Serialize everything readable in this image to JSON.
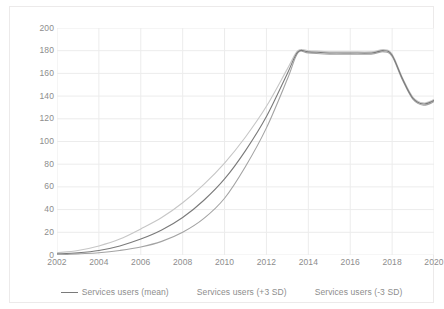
{
  "chart_data": {
    "type": "line",
    "title": "",
    "subtitle": "",
    "xlabel": "",
    "ylabel": "",
    "xlim": [
      2002,
      2020
    ],
    "ylim": [
      0,
      200
    ],
    "grid": true,
    "legend_position": "bottom",
    "y_ticks": [
      200,
      180,
      160,
      140,
      120,
      100,
      80,
      60,
      40,
      20,
      0
    ],
    "x_ticks": [
      2002,
      2004,
      2006,
      2008,
      2010,
      2012,
      2014,
      2016,
      2018,
      2020
    ],
    "x": [
      2002,
      2003,
      2004,
      2005,
      2006,
      2007,
      2008,
      2009,
      2010,
      2011,
      2012,
      2013,
      2013.5,
      2014,
      2015,
      2016,
      2017,
      2017.6,
      2018,
      2018.5,
      2019,
      2019.5,
      2020
    ],
    "series": [
      {
        "name": "Services users (mean)",
        "color": "#7a7a7a",
        "values": [
          1,
          2,
          4,
          8,
          14,
          22,
          33,
          48,
          67,
          92,
          122,
          160,
          179,
          179,
          178,
          178,
          178,
          180,
          176,
          155,
          138,
          133,
          136
        ]
      },
      {
        "name": "Services users (+3 SD)",
        "color": "#c6c6c6",
        "values": [
          2,
          4,
          8,
          14,
          23,
          33,
          46,
          62,
          81,
          104,
          131,
          164,
          180,
          180,
          179,
          179,
          179,
          181,
          177,
          156,
          139,
          134,
          137
        ]
      },
      {
        "name": "Services users (-3 SD)",
        "color": "#a3a3a3",
        "values": [
          0,
          1,
          2,
          4,
          7,
          12,
          20,
          32,
          50,
          78,
          112,
          155,
          178,
          178,
          177,
          177,
          177,
          179,
          175,
          154,
          137,
          132,
          135
        ]
      }
    ]
  },
  "legend": {
    "entries": [
      {
        "label": "Services users (mean)",
        "has_swatch": true
      },
      {
        "label": "Services users (+3 SD)",
        "has_swatch": false
      },
      {
        "label": "Services users (-3 SD)",
        "has_swatch": false
      }
    ]
  },
  "colors": {
    "grid": "#ececec",
    "axis_text": "#8d8d8d",
    "frame": "#eceaea",
    "background": "#ffffff"
  }
}
